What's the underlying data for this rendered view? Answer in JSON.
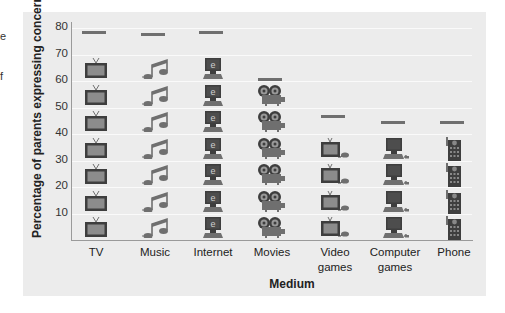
{
  "margin_fragments": [
    "e",
    "f"
  ],
  "chart_data": {
    "type": "bar",
    "style": "pictograph",
    "title": "",
    "xlabel": "Medium",
    "ylabel": "Percentage of parents expressing concern",
    "ylim": [
      0,
      80
    ],
    "yticks": [
      10,
      20,
      30,
      40,
      50,
      60,
      70,
      80
    ],
    "grid": true,
    "icon_unit": 10,
    "categories": [
      "TV",
      "Music",
      "Internet",
      "Movies",
      "Video games",
      "Computer games",
      "Phone"
    ],
    "category_labels": [
      [
        "TV"
      ],
      [
        "Music"
      ],
      [
        "Internet"
      ],
      [
        "Movies"
      ],
      [
        "Video",
        "games"
      ],
      [
        "Computer",
        "games"
      ],
      [
        "Phone"
      ]
    ],
    "values": [
      79,
      78,
      79,
      61,
      47,
      45,
      45
    ],
    "icons": [
      "tv-icon",
      "music-note-icon",
      "internet-computer-icon",
      "movie-projector-icon",
      "video-game-tv-icon",
      "computer-game-icon",
      "phone-icon"
    ]
  },
  "colors": {
    "panel_bg": "#ececec",
    "icon_fill": "#6f6f6f",
    "icon_dark": "#3e3e3e",
    "tv_screen": "#8c8c8c"
  }
}
